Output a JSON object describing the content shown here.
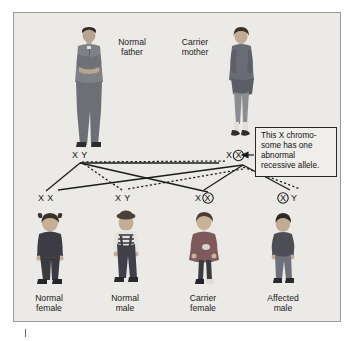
{
  "figure": {
    "title_semantic": "x-linked-recessive-inheritance-pedigree",
    "background_color": "#eceae6",
    "border_color": "#9a9a98"
  },
  "parents": [
    {
      "id": "father",
      "label_line1": "Normal",
      "label_line2": "father",
      "genotype": "X Y",
      "carrier": false
    },
    {
      "id": "mother",
      "label_line1": "Carrier",
      "label_line2": "mother",
      "genotype_normal": "X",
      "genotype_affected": "X",
      "carrier": true
    }
  ],
  "children": [
    {
      "id": "normal-female",
      "label_line1": "Normal",
      "label_line2": "female",
      "allele1": "X",
      "allele2": "X",
      "allele1_circled": false,
      "allele2_circled": false
    },
    {
      "id": "normal-male",
      "label_line1": "Normal",
      "label_line2": "male",
      "allele1": "X",
      "allele2": "Y",
      "allele1_circled": false,
      "allele2_circled": false
    },
    {
      "id": "carrier-female",
      "label_line1": "Carrier",
      "label_line2": "female",
      "allele1": "X",
      "allele2": "X",
      "allele1_circled": false,
      "allele2_circled": true
    },
    {
      "id": "affected-male",
      "label_line1": "Affected",
      "label_line2": "male",
      "allele1": "X",
      "allele2": "Y",
      "allele1_circled": true,
      "allele2_circled": false
    }
  ],
  "callout": {
    "text": "This X chromo-some has one abnormal recessive allele.",
    "line1": "This X chromo-",
    "line2": "some has one",
    "line3": "abnormal",
    "line4": "recessive allele.",
    "border_color": "#2a2a2a"
  },
  "legend_note": {
    "solid_line_meaning": "allele contributed from father",
    "dotted_line_meaning": "allele contributed from mother"
  }
}
